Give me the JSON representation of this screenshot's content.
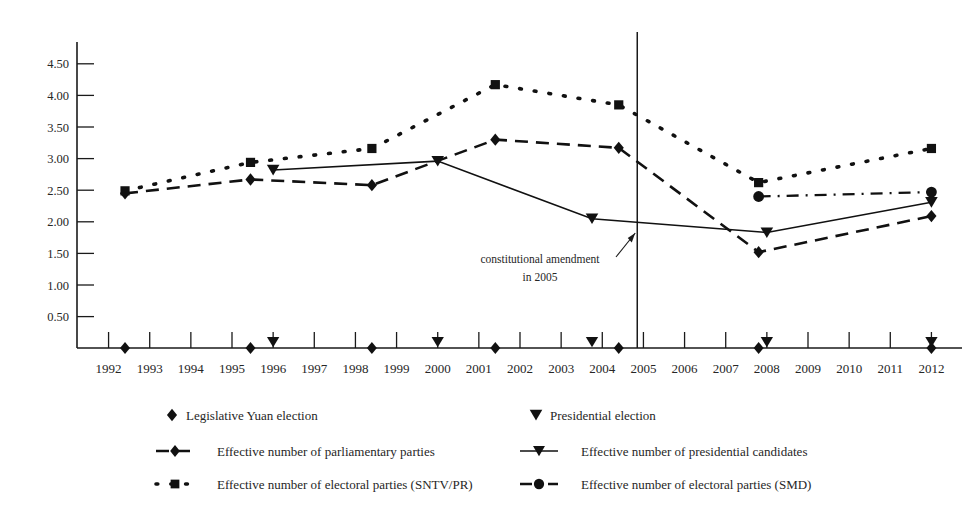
{
  "chart_data": {
    "type": "line",
    "title": "",
    "xlabel": "",
    "ylabel": "",
    "x": [
      1992,
      1993,
      1994,
      1995,
      1996,
      1997,
      1998,
      1999,
      2000,
      2001,
      2002,
      2003,
      2004,
      2005,
      2006,
      2007,
      2008,
      2009,
      2010,
      2011,
      2012
    ],
    "xlim": [
      1991.5,
      2012.5
    ],
    "ylim": [
      0,
      4.75
    ],
    "yticks": [
      0.5,
      1.0,
      1.5,
      2.0,
      2.5,
      3.0,
      3.5,
      4.0,
      4.5
    ],
    "ytick_labels": [
      "0.50",
      "1.00",
      "1.50",
      "2.00",
      "2.50",
      "3.00",
      "3.50",
      "4.00",
      "4.50"
    ],
    "xtick_labels": [
      "1992",
      "1993",
      "1994",
      "1995",
      "1996",
      "1997",
      "1998",
      "1999",
      "2000",
      "2001",
      "2002",
      "2003",
      "2004",
      "2005",
      "2006",
      "2007",
      "2008",
      "2009",
      "2010",
      "2011",
      "2012"
    ],
    "grid": false,
    "legend_position": "below",
    "series": [
      {
        "name": "Effective number of parliamentary parties",
        "marker": "diamond",
        "linestyle": "dashed",
        "points": [
          {
            "x": 1992.4,
            "y": 2.45
          },
          {
            "x": 1995.45,
            "y": 2.67
          },
          {
            "x": 1998.4,
            "y": 2.58
          },
          {
            "x": 2001.4,
            "y": 3.3
          },
          {
            "x": 2004.4,
            "y": 3.17
          },
          {
            "x": 2007.8,
            "y": 1.52
          },
          {
            "x": 2012.0,
            "y": 2.09
          }
        ]
      },
      {
        "name": "Effective number of electoral parties (SNTV/PR)",
        "marker": "square",
        "linestyle": "dotted",
        "points": [
          {
            "x": 1992.4,
            "y": 2.49
          },
          {
            "x": 1995.45,
            "y": 2.94
          },
          {
            "x": 1998.4,
            "y": 3.16
          },
          {
            "x": 2001.4,
            "y": 4.17
          },
          {
            "x": 2004.4,
            "y": 3.85
          },
          {
            "x": 2007.8,
            "y": 2.62
          },
          {
            "x": 2012.0,
            "y": 3.16
          }
        ]
      },
      {
        "name": "Effective number of presidential candidates",
        "marker": "triangle-down",
        "linestyle": "solid",
        "points": [
          {
            "x": 1996.0,
            "y": 2.82
          },
          {
            "x": 2000.0,
            "y": 2.96
          },
          {
            "x": 2003.75,
            "y": 2.05
          },
          {
            "x": 2008.0,
            "y": 1.83
          },
          {
            "x": 2012.0,
            "y": 2.31
          }
        ]
      },
      {
        "name": "Effective number of electoral parties (SMD)",
        "marker": "circle",
        "linestyle": "dashdot",
        "points": [
          {
            "x": 2007.8,
            "y": 2.4
          },
          {
            "x": 2012.0,
            "y": 2.47
          }
        ]
      }
    ],
    "event_markers": [
      {
        "name": "Legislative Yuan election",
        "marker": "diamond",
        "x": [
          1992.4,
          1995.45,
          1998.4,
          2001.4,
          2004.4,
          2007.8,
          2012.0
        ]
      },
      {
        "name": "Presidential election",
        "marker": "triangle-down",
        "x": [
          1996.0,
          2000.0,
          2003.75,
          2008.0,
          2012.0
        ]
      }
    ],
    "annotations": [
      {
        "text_line1": "constitutional amendment",
        "text_line2": "in 2005",
        "event_x": 2004.85,
        "label": "constitutional amendment in 2005"
      }
    ]
  },
  "legend": {
    "items": [
      {
        "label": "Legislative Yuan  election",
        "marker": "diamond",
        "linestyle": "none"
      },
      {
        "label": "Presidential election",
        "marker": "triangle-down",
        "linestyle": "none"
      },
      {
        "label": "Effective number of parliamentary parties",
        "marker": "diamond",
        "linestyle": "dashed"
      },
      {
        "label": "Effective number of presidential candidates",
        "marker": "triangle-down",
        "linestyle": "solid"
      },
      {
        "label": "Effective number of electoral parties (SNTV/PR)",
        "marker": "square",
        "linestyle": "dotted"
      },
      {
        "label": "Effective number of electoral parties (SMD)",
        "marker": "circle",
        "linestyle": "dashdot"
      }
    ]
  },
  "colors": {
    "ink": "#111111",
    "axis": "#1a1a1a",
    "background": "#ffffff"
  }
}
